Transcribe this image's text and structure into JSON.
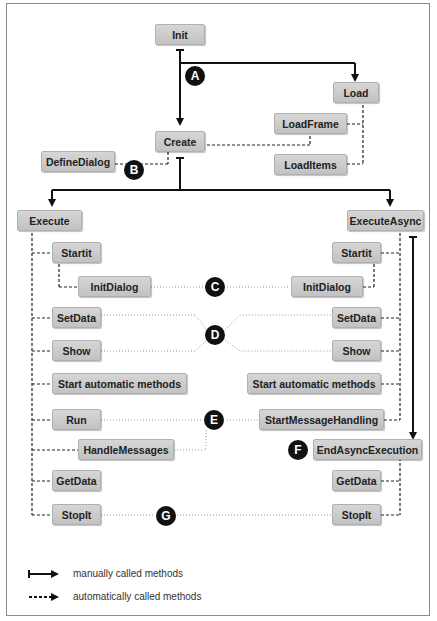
{
  "nodes": {
    "init": "Init",
    "load": "Load",
    "load_frame": "LoadFrame",
    "create": "Create",
    "define_dialog": "DefineDialog",
    "load_items": "LoadItems",
    "execute": "Execute",
    "execute_async": "ExecuteAsync",
    "left": {
      "startit": "Startit",
      "init_dialog": "InitDialog",
      "set_data": "SetData",
      "show": "Show",
      "start_auto": "Start automatic methods",
      "run": "Run",
      "handle_messages": "HandleMessages",
      "get_data": "GetData",
      "stop_it": "StopIt"
    },
    "right": {
      "startit": "Startit",
      "init_dialog": "InitDialog",
      "set_data": "SetData",
      "show": "Show",
      "start_auto": "Start automatic methods",
      "start_message_handling": "StartMessageHandling",
      "end_async_execution": "EndAsyncExecution",
      "get_data": "GetData",
      "stop_it": "StopIt"
    }
  },
  "badges": {
    "a": "A",
    "b": "B",
    "c": "C",
    "d": "D",
    "e": "E",
    "f": "F",
    "g": "G"
  },
  "legend": {
    "manual": "manually called methods",
    "automatic": "automatically called methods"
  }
}
